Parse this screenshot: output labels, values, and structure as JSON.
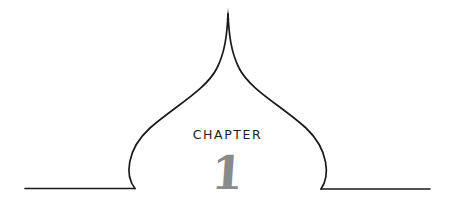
{
  "chapter": {
    "label": "CHAPTER",
    "number": "1"
  },
  "colors": {
    "line": "#1a1a1a",
    "label": "#1e1e1e",
    "number": "#8a8a8a",
    "background": "#ffffff"
  }
}
